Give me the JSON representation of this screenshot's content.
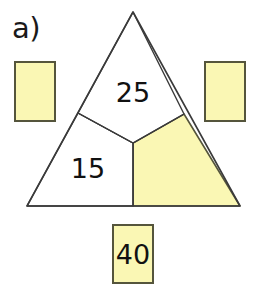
{
  "figure": {
    "part_label": "a)",
    "shape": "triangle",
    "colors": {
      "fill_yellow": "#faf7b4",
      "fill_white": "#ffffff",
      "stroke_dark": "#55553c",
      "stroke_outline": "#3a3a3a",
      "text": "#111111"
    },
    "triangle": {
      "apex": {
        "x": 133,
        "y": 12
      },
      "bottom_left": {
        "x": 27,
        "y": 206
      },
      "bottom_right": {
        "x": 240,
        "y": 206
      },
      "center": {
        "x": 133,
        "y": 143
      },
      "left_edge_split": {
        "x": 78,
        "y": 113
      },
      "right_edge_split": {
        "x": 184,
        "y": 114
      },
      "base_split": {
        "x": 133,
        "y": 206
      }
    },
    "regions": [
      {
        "id": "top",
        "name": "top-region",
        "value": "25",
        "filled": false,
        "fill": "#ffffff"
      },
      {
        "id": "bottom-left",
        "name": "bottom-left-region",
        "value": "15",
        "filled": false,
        "fill": "#ffffff"
      },
      {
        "id": "bottom-right",
        "name": "bottom-right-region",
        "value": "",
        "filled": true,
        "fill": "#faf7b4"
      }
    ],
    "answer_boxes": [
      {
        "id": "left",
        "name": "left-answer-box",
        "value": "",
        "fill": "#faf7b4"
      },
      {
        "id": "right",
        "name": "right-answer-box",
        "value": "",
        "fill": "#faf7b4"
      },
      {
        "id": "bottom",
        "name": "bottom-answer-box",
        "value": "40",
        "fill": "#faf7b4"
      }
    ]
  }
}
